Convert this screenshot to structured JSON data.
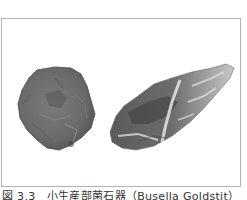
{
  "figure": {
    "caption": "図 3.3　小生産部菌石器（Busella Goldstit）",
    "frame_border_color": "#b4b4b4",
    "images": [
      {
        "name": "left-stone-tool",
        "description": "dark grey rounded flaked stone tool",
        "tone": "#6e6e6e"
      },
      {
        "name": "right-stone-tool",
        "description": "elongated light/dark speckled flaked stone tool",
        "tone": "#8a8a8a"
      }
    ]
  }
}
